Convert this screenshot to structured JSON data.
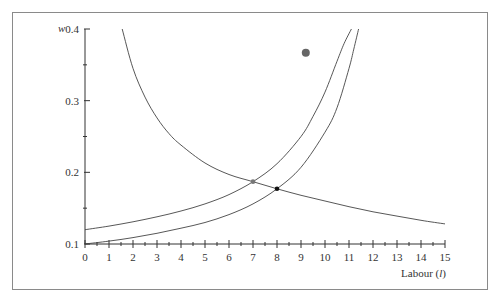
{
  "chart_data": {
    "type": "line",
    "title": "",
    "xlabel": "Labour (l)",
    "xlabel_main": "Labour (",
    "xlabel_var": "l",
    "xlabel_close": ")",
    "ylabel": "w",
    "xlim": [
      0,
      15
    ],
    "ylim": [
      0.1,
      0.4
    ],
    "x_ticks": [
      0,
      1,
      2,
      3,
      4,
      5,
      6,
      7,
      8,
      9,
      10,
      11,
      12,
      13,
      14,
      15
    ],
    "x_tick_labels": [
      "0",
      "1",
      "2",
      "3",
      "4",
      "5",
      "6",
      "7",
      "8",
      "9",
      "10",
      "11",
      "12",
      "13",
      "14",
      "15"
    ],
    "y_ticks": [
      0.1,
      0.2,
      0.3,
      0.4
    ],
    "y_tick_labels": [
      "0.1",
      "0.2",
      "0.3",
      "0.4"
    ],
    "grid": false,
    "series": [
      {
        "name": "labour demand",
        "x": [
          1.55,
          2,
          2.5,
          3,
          3.5,
          4,
          5,
          6,
          7,
          8,
          9,
          10,
          11,
          12,
          13,
          14,
          15
        ],
        "y": [
          0.4,
          0.345,
          0.305,
          0.276,
          0.254,
          0.238,
          0.213,
          0.197,
          0.187,
          0.177,
          0.168,
          0.16,
          0.152,
          0.145,
          0.139,
          0.133,
          0.128
        ]
      },
      {
        "name": "labour supply (upper)",
        "x": [
          0,
          1,
          2,
          3,
          4,
          5,
          6,
          7,
          8,
          9,
          9.5,
          10,
          10.5,
          10.8,
          11.1
        ],
        "y": [
          0.12,
          0.125,
          0.131,
          0.138,
          0.146,
          0.156,
          0.169,
          0.187,
          0.212,
          0.25,
          0.278,
          0.312,
          0.355,
          0.38,
          0.4
        ]
      },
      {
        "name": "labour supply (lower)",
        "x": [
          0,
          1,
          2,
          3,
          4,
          5,
          6,
          7,
          8,
          9,
          10,
          10.5,
          11,
          11.2,
          11.4
        ],
        "y": [
          0.1,
          0.104,
          0.109,
          0.115,
          0.122,
          0.13,
          0.141,
          0.156,
          0.177,
          0.207,
          0.256,
          0.29,
          0.345,
          0.372,
          0.4
        ]
      }
    ],
    "points": [
      {
        "name": "equilibrium-1",
        "x": 7,
        "y": 0.187,
        "color": "#777777"
      },
      {
        "name": "equilibrium-2",
        "x": 8,
        "y": 0.177,
        "color": "#111111"
      },
      {
        "name": "marker",
        "x": 9.2,
        "y": 0.367,
        "color": "#666666"
      }
    ]
  }
}
